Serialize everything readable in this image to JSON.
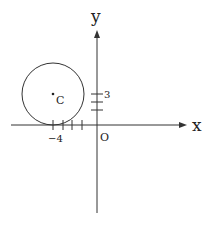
{
  "diagram": {
    "type": "coordinate-plane",
    "axes": {
      "x_label": "x",
      "y_label": "y",
      "origin_label": "O"
    },
    "circle": {
      "center_label": "C",
      "center": [
        -4,
        3
      ],
      "radius": 3,
      "tangent_to": "x-axis"
    },
    "ticks": {
      "x": [
        -4,
        -3,
        -2,
        -1
      ],
      "y": [
        1,
        2,
        3
      ],
      "x_label_shown": "−4",
      "y_label_shown": "3"
    },
    "colors": {
      "stroke": "#333333",
      "background": "#ffffff"
    }
  }
}
